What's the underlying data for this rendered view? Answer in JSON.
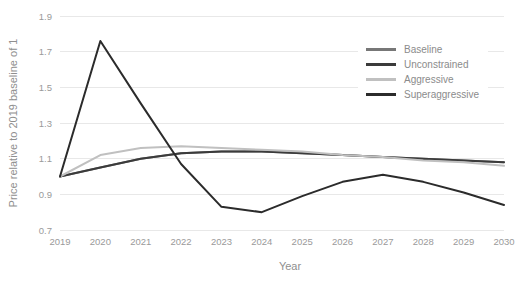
{
  "chart_data": {
    "type": "line",
    "title": "",
    "xlabel": "Year",
    "ylabel": "Price relative to 2019 baseline of 1",
    "x": [
      2019,
      2020,
      2021,
      2022,
      2023,
      2024,
      2025,
      2026,
      2027,
      2028,
      2029,
      2030
    ],
    "categories": [
      "2019",
      "2020",
      "2021",
      "2022",
      "2023",
      "2024",
      "2025",
      "2026",
      "2027",
      "2028",
      "2029",
      "2030"
    ],
    "xlim": [
      2019,
      2030
    ],
    "ylim": [
      0.7,
      1.9
    ],
    "yticks": [
      0.7,
      0.9,
      1.1,
      1.3,
      1.5,
      1.7,
      1.9
    ],
    "ytick_labels": [
      "0.7",
      "0.9",
      "1.1",
      "1.3",
      "1.5",
      "1.7",
      "1.9"
    ],
    "grid": true,
    "grid_axis": "y",
    "legend_position": "upper right",
    "series": [
      {
        "name": "Baseline",
        "color": "#777777",
        "values": [
          1.0,
          1.05,
          1.1,
          1.13,
          1.14,
          1.14,
          1.13,
          1.12,
          1.11,
          1.1,
          1.09,
          1.08
        ]
      },
      {
        "name": "Unconstrained",
        "color": "#3b3b3b",
        "values": [
          1.0,
          1.05,
          1.1,
          1.13,
          1.14,
          1.14,
          1.13,
          1.12,
          1.11,
          1.1,
          1.09,
          1.08
        ]
      },
      {
        "name": "Aggressive",
        "color": "#c0c0c0",
        "values": [
          1.0,
          1.12,
          1.16,
          1.17,
          1.16,
          1.15,
          1.14,
          1.12,
          1.11,
          1.09,
          1.08,
          1.06
        ]
      },
      {
        "name": "Superaggressive",
        "color": "#2b2b2b",
        "values": [
          1.0,
          1.76,
          1.41,
          1.07,
          0.83,
          0.8,
          0.89,
          0.97,
          1.01,
          0.97,
          0.91,
          0.84
        ]
      }
    ]
  },
  "legend": {
    "items": [
      {
        "label": "Baseline"
      },
      {
        "label": "Unconstrained"
      },
      {
        "label": "Aggressive"
      },
      {
        "label": "Superaggressive"
      }
    ]
  },
  "axes": {
    "x_title": "Year",
    "y_title": "Price relative to 2019 baseline of 1"
  }
}
